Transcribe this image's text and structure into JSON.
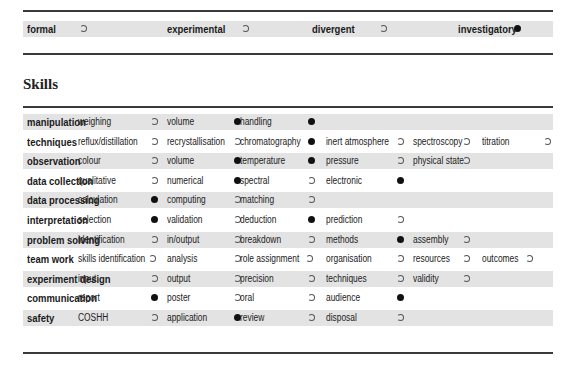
{
  "investigation_types": [
    {
      "label": "formal",
      "selected": false
    },
    {
      "label": "experimental",
      "selected": false
    },
    {
      "label": "divergent",
      "selected": false
    },
    {
      "label": "investigatory",
      "selected": true
    }
  ],
  "skills": {
    "title": "Skills",
    "rows": [
      {
        "category": "manipulation",
        "items": [
          {
            "label": "weighing",
            "selected": false
          },
          {
            "label": "volume",
            "selected": true
          },
          {
            "label": "handling",
            "selected": true
          }
        ]
      },
      {
        "category": "techniques",
        "items": [
          {
            "label": "reflux/distillation",
            "selected": false
          },
          {
            "label": "recrystallisation",
            "selected": false
          },
          {
            "label": "chromatography",
            "selected": true
          },
          {
            "label": "inert atmosphere",
            "selected": false
          },
          {
            "label": "spectroscopy",
            "selected": false
          },
          {
            "label": "titration",
            "selected": false
          }
        ]
      },
      {
        "category": "observation",
        "items": [
          {
            "label": "colour",
            "selected": false
          },
          {
            "label": "volume",
            "selected": true
          },
          {
            "label": "temperature",
            "selected": true
          },
          {
            "label": "pressure",
            "selected": false
          },
          {
            "label": "physical  state",
            "selected": false
          }
        ]
      },
      {
        "category": "data collection",
        "items": [
          {
            "label": "qualitative",
            "selected": false
          },
          {
            "label": "numerical",
            "selected": true
          },
          {
            "label": "spectral",
            "selected": false
          },
          {
            "label": "electronic",
            "selected": true
          }
        ]
      },
      {
        "category": "data processing",
        "items": [
          {
            "label": "calculation",
            "selected": true
          },
          {
            "label": "computing",
            "selected": false
          },
          {
            "label": "matching",
            "selected": false
          }
        ]
      },
      {
        "category": "interpretation",
        "items": [
          {
            "label": "selection",
            "selected": true
          },
          {
            "label": "validation",
            "selected": false
          },
          {
            "label": "deduction",
            "selected": true
          },
          {
            "label": "prediction",
            "selected": false
          }
        ]
      },
      {
        "category": "problem solving",
        "items": [
          {
            "label": "identification",
            "selected": false
          },
          {
            "label": "in/output",
            "selected": false
          },
          {
            "label": "breakdown",
            "selected": false
          },
          {
            "label": "methods",
            "selected": true
          },
          {
            "label": "assembly",
            "selected": false
          }
        ]
      },
      {
        "category": "team work",
        "items": [
          {
            "label": "skills identification",
            "selected": false
          },
          {
            "label": "analysis",
            "selected": false
          },
          {
            "label": "role assignment",
            "selected": false
          },
          {
            "label": "organisation",
            "selected": false
          },
          {
            "label": "resources",
            "selected": false
          },
          {
            "label": "outcomes",
            "selected": false
          }
        ]
      },
      {
        "category": "experiment design",
        "items": [
          {
            "label": "input",
            "selected": false
          },
          {
            "label": "output",
            "selected": false
          },
          {
            "label": "precision",
            "selected": false
          },
          {
            "label": "techniques",
            "selected": false
          },
          {
            "label": "validity",
            "selected": false
          }
        ]
      },
      {
        "category": "communication",
        "items": [
          {
            "label": "report",
            "selected": true
          },
          {
            "label": "poster",
            "selected": false
          },
          {
            "label": "oral",
            "selected": false
          },
          {
            "label": "audience",
            "selected": true
          }
        ]
      },
      {
        "category": "safety",
        "items": [
          {
            "label": "COSHH",
            "selected": false
          },
          {
            "label": "application",
            "selected": true
          },
          {
            "label": "review",
            "selected": false
          },
          {
            "label": "disposal",
            "selected": false
          }
        ]
      }
    ]
  },
  "colors": {
    "band": "#e3e3e3",
    "rule": "#3a3a3a",
    "dot_on": "#111111"
  }
}
